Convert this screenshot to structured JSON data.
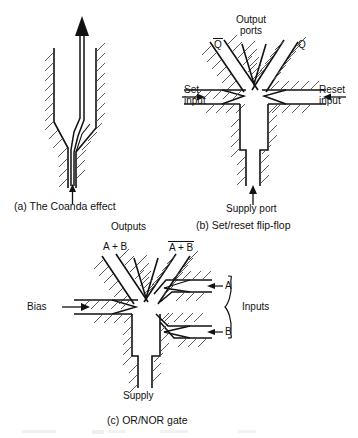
{
  "document": {
    "type": "technical-diagram",
    "subject": "Fluidic logic devices",
    "panel_count": 3
  },
  "colors": {
    "ink": "#111111",
    "hatch": "#4a4a4a",
    "background": "#ffffff"
  },
  "panels": [
    {
      "id": "a",
      "caption": "(a)  The Coanda effect",
      "labels": []
    },
    {
      "id": "b",
      "caption": "(b)  Set/reset flip-flop",
      "labels": [
        {
          "name": "output-ports",
          "line1": "Output",
          "line2": "ports"
        },
        {
          "name": "q-bar-output",
          "text": "Q",
          "overbar": true
        },
        {
          "name": "q-output",
          "text": "Q",
          "overbar": false
        },
        {
          "name": "set-input",
          "line1": "Set",
          "line2": "input"
        },
        {
          "name": "reset-input",
          "line1": "Reset",
          "line2": "input"
        },
        {
          "name": "supply-port",
          "text": "Supply port"
        }
      ]
    },
    {
      "id": "c",
      "caption": "(c)  OR/NOR gate",
      "labels": [
        {
          "name": "outputs-group",
          "text": "Outputs"
        },
        {
          "name": "or-output",
          "text": "A + B",
          "overbar": false
        },
        {
          "name": "nor-output",
          "text": "A + B",
          "overbar": true
        },
        {
          "name": "bias-input",
          "text": "Bias"
        },
        {
          "name": "input-a",
          "text": "A"
        },
        {
          "name": "input-b",
          "text": "B"
        },
        {
          "name": "inputs-group",
          "text": "Inputs"
        },
        {
          "name": "supply",
          "text": "Supply"
        }
      ]
    }
  ]
}
